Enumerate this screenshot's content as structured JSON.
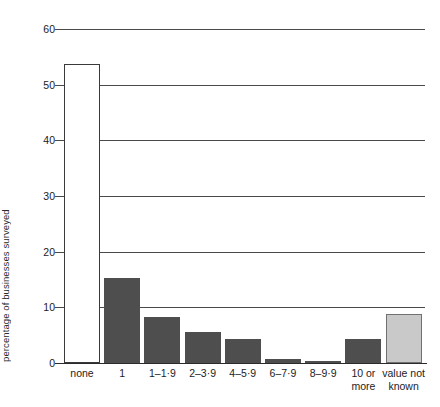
{
  "chart_data": {
    "type": "bar",
    "title": "",
    "xlabel": "",
    "ylabel": "percentage of businesses surveyed",
    "ylim": [
      0,
      60
    ],
    "ytick_step": 10,
    "yticks": [
      "0",
      "10",
      "20",
      "30",
      "40",
      "50",
      "60"
    ],
    "grid": "horizontal",
    "legend": "none",
    "categories": [
      "none",
      "1",
      "1–1·9",
      "2–3·9",
      "4–5·9",
      "6–7·9",
      "8–9·9",
      "10 or\nmore",
      "value not\nknown"
    ],
    "values": [
      53.8,
      15.2,
      8.2,
      5.5,
      4.3,
      0.8,
      0.3,
      4.3,
      8.8
    ],
    "bar_styles": [
      "hollow",
      "solid",
      "solid",
      "solid",
      "solid",
      "solid",
      "solid",
      "solid",
      "light"
    ],
    "colors": {
      "solid_fill": "#4e4e4e",
      "hollow_fill": "#ffffff",
      "hollow_stroke": "#3a3a3a",
      "light_fill": "#c9c9c9",
      "light_stroke": "#707070",
      "gridline": "#4a4a4a",
      "axis": "#2b2b2b",
      "text": "#1c1c1c",
      "background": "#ffffff"
    }
  }
}
